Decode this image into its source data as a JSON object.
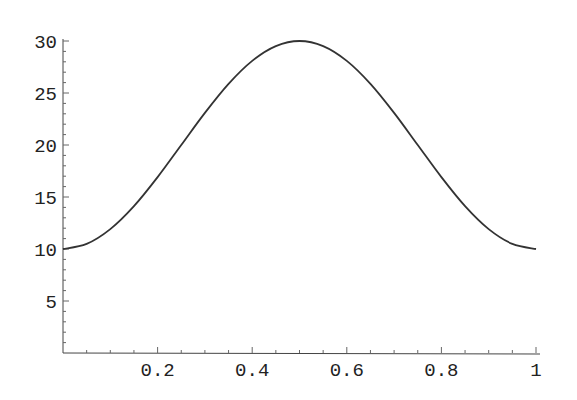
{
  "chart_data": {
    "type": "line",
    "title": "",
    "xlabel": "",
    "ylabel": "",
    "xlim": [
      0,
      1
    ],
    "ylim": [
      0,
      30
    ],
    "grid": false,
    "legend": null,
    "x_ticks": [
      0.2,
      0.4,
      0.6,
      0.8,
      1
    ],
    "x_tick_labels": [
      "0.2",
      "0.4",
      "0.6",
      "0.8",
      "1"
    ],
    "y_ticks": [
      5,
      10,
      15,
      20,
      25,
      30
    ],
    "y_tick_labels": [
      "5",
      "10",
      "15",
      "20",
      "25",
      "30"
    ],
    "series": [
      {
        "name": "f(x)",
        "color": "#333333",
        "x": [
          0,
          0.05,
          0.1,
          0.15,
          0.2,
          0.25,
          0.3,
          0.35,
          0.4,
          0.45,
          0.5,
          0.55,
          0.6,
          0.65,
          0.7,
          0.75,
          0.8,
          0.85,
          0.9,
          0.95,
          1
        ],
        "y": [
          10,
          10.49,
          11.91,
          14.12,
          16.91,
          20,
          23.09,
          25.88,
          28.09,
          29.51,
          30,
          29.51,
          28.09,
          25.88,
          23.09,
          20,
          16.91,
          14.12,
          11.91,
          10.49,
          10
        ]
      }
    ]
  }
}
